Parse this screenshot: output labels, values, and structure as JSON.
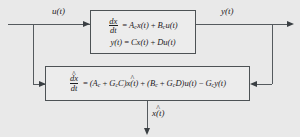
{
  "diagram": {
    "background_color": "#e9e9e9",
    "line_color": "#555a5e",
    "block_fill": "#ececec",
    "signals": {
      "input": "u(t)",
      "output": "y(t)",
      "estimate_hat": "^",
      "estimate_base": "x(t)"
    },
    "plant_block": {
      "name": "plant-state-space-block",
      "equation_1": {
        "lhs_num": "dx",
        "lhs_den": "dt",
        "equals": "=",
        "term_1_matrix": "A",
        "term_1_sub": "c",
        "term_1_var": "x(t)",
        "plus": "+",
        "term_2_matrix": "B",
        "term_2_sub": "c",
        "term_2_var": "u(t)"
      },
      "equation_2": {
        "lhs": "y(t)",
        "equals": "=",
        "term_1": "Cx(t)",
        "plus": "+",
        "term_2": "Du(t)"
      }
    },
    "observer_block": {
      "name": "observer-state-space-block",
      "equation": {
        "lhs_num_hat": "^",
        "lhs_num": "dx",
        "lhs_den": "dt",
        "equals": "=",
        "open_1": "(",
        "a_matrix": "A",
        "a_sub": "c",
        "plus_1": "+",
        "g_matrix_1": "G",
        "g_sub_1": "c",
        "c_matrix": "C",
        "close_1": ")",
        "xhat_hat": "^",
        "xhat_var": "x(t)",
        "plus_2": "+",
        "open_2": "(",
        "b_matrix": "B",
        "b_sub": "c",
        "plus_3": "+",
        "g_matrix_2": "G",
        "g_sub_2": "c",
        "d_matrix": "D",
        "close_2": ")",
        "u_var": "u(t)",
        "minus": "−",
        "g_matrix_3": "G",
        "g_sub_3": "c",
        "y_var": "y(t)"
      }
    }
  }
}
